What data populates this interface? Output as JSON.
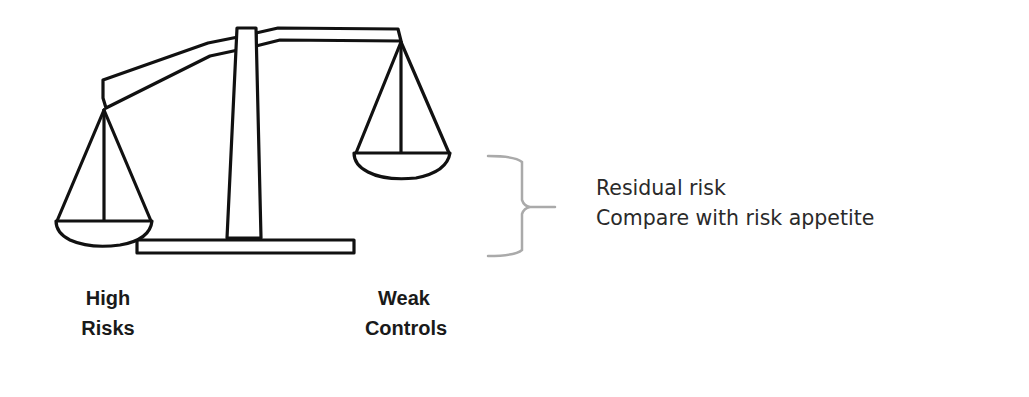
{
  "diagram": {
    "type": "balance-scale",
    "left_pan": {
      "label_line1": "High",
      "label_line2": "Risks",
      "position": "down"
    },
    "right_pan": {
      "label_line1": "Weak",
      "label_line2": "Controls",
      "position": "up"
    },
    "annotation": {
      "line1": "Residual risk",
      "line2": "Compare with risk appetite"
    },
    "colors": {
      "stroke": "#111111",
      "bracket": "#aaaaaa",
      "background": "#ffffff"
    }
  }
}
